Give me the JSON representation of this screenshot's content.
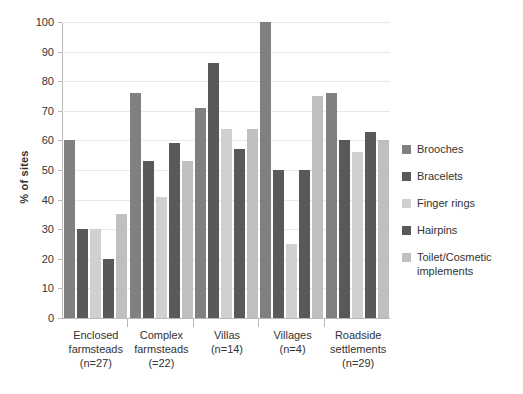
{
  "chart_data": {
    "type": "bar",
    "title": "",
    "xlabel": "",
    "ylabel": "% of sites",
    "ylim": [
      0,
      100
    ],
    "yticks": [
      0,
      10,
      20,
      30,
      40,
      50,
      60,
      70,
      80,
      90,
      100
    ],
    "grid": true,
    "legend_position": "right",
    "categories": [
      "Enclosed farmsteads (n=27)",
      "Complex farmsteads (=22)",
      "Villas (n=14)",
      "Villages (n=4)",
      "Roadside settlements (n=29)"
    ],
    "category_lines": [
      [
        "Enclosed",
        "farmsteads",
        "(n=27)"
      ],
      [
        "Complex",
        "farmsteads",
        "(=22)"
      ],
      [
        "Villas",
        "(n=14)"
      ],
      [
        "Villages",
        "(n=4)"
      ],
      [
        "Roadside",
        "settlements",
        "(n=29)"
      ]
    ],
    "series": [
      {
        "name": "Brooches",
        "color": "#808080",
        "values": [
          60,
          76,
          71,
          100,
          76
        ]
      },
      {
        "name": "Bracelets",
        "color": "#595959",
        "values": [
          30,
          53,
          86,
          50,
          60
        ]
      },
      {
        "name": "Finger rings",
        "color": "#d0d0d0",
        "values": [
          30,
          41,
          64,
          25,
          56
        ]
      },
      {
        "name": "Hairpins",
        "color": "#595959",
        "values": [
          20,
          59,
          57,
          50,
          63
        ]
      },
      {
        "name": "Toilet/Cosmetic implements",
        "color": "#bfbfbf",
        "values": [
          35,
          53,
          64,
          75,
          60
        ]
      }
    ],
    "legend_entries": [
      {
        "label": "Brooches"
      },
      {
        "label": "Bracelets"
      },
      {
        "label": "Finger rings"
      },
      {
        "label": "Hairpins"
      },
      {
        "label": "Toilet/Cosmetic implements"
      }
    ]
  }
}
